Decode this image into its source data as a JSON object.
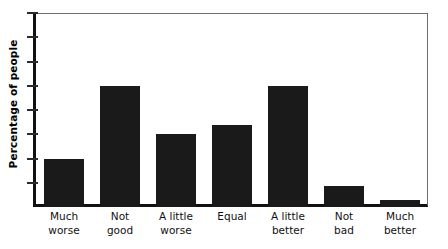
{
  "chart_data": {
    "type": "bar",
    "title": "",
    "xlabel": "",
    "ylabel": "Percentage of people",
    "categories": [
      "Much worse",
      "Not good",
      "A little worse",
      "Equal",
      "A little better",
      "Not bad",
      "Much better"
    ],
    "category_lines": [
      [
        "Much",
        "worse"
      ],
      [
        "Not",
        "good"
      ],
      [
        "A little",
        "worse"
      ],
      [
        "Equal",
        ""
      ],
      [
        "A little",
        "better"
      ],
      [
        "Not",
        "bad"
      ],
      [
        "Much",
        "better"
      ]
    ],
    "values": [
      2.0,
      5.0,
      3.0,
      3.4,
      5.0,
      0.85,
      0.3
    ],
    "ylim": [
      0,
      8
    ],
    "y_tick_values": [
      1,
      2,
      3,
      4,
      5,
      6,
      7,
      8
    ],
    "y_tick_labels": [
      "",
      "",
      "",
      "",
      "",
      "",
      "",
      ""
    ],
    "x_tick_labels": [],
    "grid": false,
    "legend": null,
    "bar_color": "#1a1a1a",
    "axis_color": "#111111",
    "frame_color": "#6f6f6f",
    "background_color": "#ffffff"
  },
  "axis": {
    "y_title": "Percentage of people"
  }
}
